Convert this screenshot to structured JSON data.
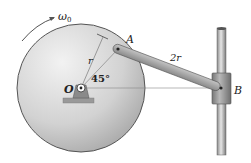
{
  "diagram": {
    "labels": {
      "omega": "ω",
      "omega_sub": "0",
      "radius": "r",
      "point_a": "A",
      "point_o": "O",
      "angle": "45°",
      "link_length": "2r",
      "point_b": "B"
    },
    "colors": {
      "disk_light": "#e8e8e8",
      "disk_dark": "#a9a9a9",
      "disk_edge": "#555555",
      "link": "#9a9a9a",
      "rod": "#b0b0b0",
      "collar": "#8f8f8f",
      "ink": "#222222"
    }
  }
}
